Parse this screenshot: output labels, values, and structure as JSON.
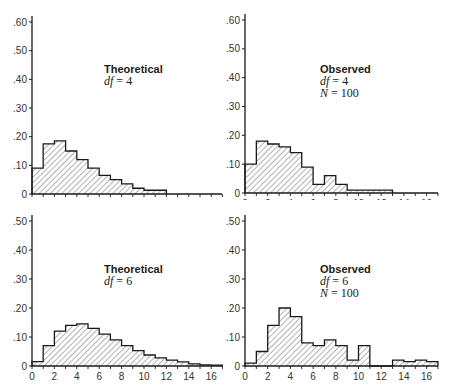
{
  "chart_data": [
    {
      "id": "top-left",
      "type": "bar",
      "subtype": "histogram",
      "title": "Theoretical",
      "annotations": [
        "Theoretical",
        "df = 4"
      ],
      "df": "4",
      "bin_edges": [
        0,
        1,
        2,
        3,
        4,
        5,
        6,
        7,
        8,
        9,
        10,
        11,
        12
      ],
      "values": [
        0.09,
        0.175,
        0.185,
        0.15,
        0.12,
        0.09,
        0.065,
        0.05,
        0.035,
        0.02,
        0.013,
        0.013
      ],
      "xlim": [
        0,
        17
      ],
      "ylim": [
        0,
        0.6
      ],
      "xticks": [
        "0",
        "2",
        "4",
        "6",
        "8",
        "10",
        "12",
        "14",
        "16"
      ],
      "yticks": [
        "0",
        ".10",
        ".20",
        ".30",
        ".40",
        ".50",
        ".60"
      ],
      "xlabel": "",
      "ylabel": "",
      "grid": false
    },
    {
      "id": "top-right",
      "type": "bar",
      "subtype": "histogram",
      "title": "Observed",
      "annotations": [
        "Observed",
        "df = 4",
        "N = 100"
      ],
      "df": "4",
      "N": "100",
      "bin_edges": [
        0,
        1,
        2,
        3,
        4,
        5,
        6,
        7,
        8,
        9,
        10,
        11,
        12,
        13
      ],
      "values": [
        0.1,
        0.18,
        0.17,
        0.16,
        0.14,
        0.09,
        0.03,
        0.06,
        0.03,
        0.01,
        0.01,
        0.01,
        0.01
      ],
      "xlim": [
        0,
        17
      ],
      "ylim": [
        0,
        0.6
      ],
      "xticks": [
        "0",
        "2",
        "4",
        "6",
        "8",
        "10",
        "12",
        "14",
        "16"
      ],
      "yticks": [
        "0",
        ".10",
        ".20",
        ".30",
        ".40",
        ".50",
        ".60"
      ],
      "xlabel": "",
      "ylabel": "",
      "grid": false
    },
    {
      "id": "bottom-left",
      "type": "bar",
      "subtype": "histogram",
      "title": "Theoretical",
      "annotations": [
        "Theoretical",
        "df = 6"
      ],
      "df": "6",
      "bin_edges": [
        0,
        1,
        2,
        3,
        4,
        5,
        6,
        7,
        8,
        9,
        10,
        11,
        12,
        13,
        14,
        15,
        16,
        17
      ],
      "values": [
        0.015,
        0.07,
        0.12,
        0.14,
        0.145,
        0.13,
        0.11,
        0.09,
        0.07,
        0.053,
        0.038,
        0.028,
        0.02,
        0.014,
        0.007,
        0.004,
        0.003
      ],
      "xlim": [
        0,
        17
      ],
      "ylim": [
        0,
        0.5
      ],
      "xticks": [
        "0",
        "2",
        "4",
        "6",
        "8",
        "10",
        "12",
        "14",
        "16"
      ],
      "yticks": [
        "0",
        ".10",
        ".20",
        ".30",
        ".40",
        ".50"
      ],
      "xlabel": "",
      "ylabel": "",
      "grid": false
    },
    {
      "id": "bottom-right",
      "type": "bar",
      "subtype": "histogram",
      "title": "Observed",
      "annotations": [
        "Observed",
        "df = 6",
        "N = 100"
      ],
      "df": "6",
      "N": "100",
      "bin_edges": [
        0,
        1,
        2,
        3,
        4,
        5,
        6,
        7,
        8,
        9,
        10,
        11,
        12,
        13,
        14,
        15,
        16,
        17
      ],
      "values": [
        0.01,
        0.05,
        0.14,
        0.2,
        0.17,
        0.08,
        0.07,
        0.09,
        0.07,
        0.02,
        0.07,
        0,
        0,
        0.02,
        0.015,
        0.02,
        0.015
      ],
      "xlim": [
        0,
        17
      ],
      "ylim": [
        0,
        0.5
      ],
      "xticks": [
        "0",
        "2",
        "4",
        "6",
        "8",
        "10",
        "12",
        "14",
        "16"
      ],
      "yticks": [
        "0",
        ".10",
        ".20",
        ".30",
        ".40",
        ".50"
      ],
      "xlabel": "",
      "ylabel": "",
      "grid": false
    }
  ],
  "panels": {
    "top_left": {
      "title": "Theoretical",
      "df_label": "df",
      "df_value": "4"
    },
    "top_right": {
      "title": "Observed",
      "df_label": "df",
      "df_value": "4",
      "n_label": "N",
      "n_value": "100"
    },
    "bottom_left": {
      "title": "Theoretical",
      "df_label": "df",
      "df_value": "6"
    },
    "bottom_right": {
      "title": "Observed",
      "df_label": "df",
      "df_value": "6",
      "n_label": "N",
      "n_value": "100"
    }
  },
  "colors": {
    "axis": "#1a1a1a",
    "bar_outline": "#1a1a1a",
    "hatch": "#555555",
    "background": "#ffffff"
  }
}
